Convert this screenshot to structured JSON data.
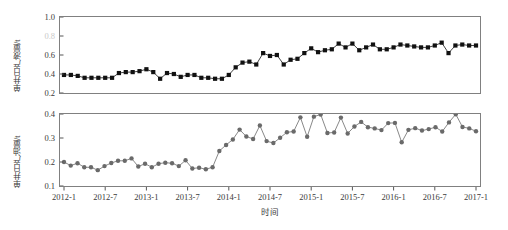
{
  "figure": {
    "background": "#ffffff",
    "xlabel": "时间",
    "xticks": [
      "2012-1",
      "2012-7",
      "2013-1",
      "2013-7",
      "2014-1",
      "2014-7",
      "2015-1",
      "2015-7",
      "2016-1",
      "2016-7",
      "2017-1"
    ]
  },
  "chart_data": [
    {
      "type": "line",
      "panel": "top",
      "title": "",
      "xlabel": "",
      "ylabel": "单井日产液量/t",
      "marker": "square",
      "marker_color": "#111111",
      "line_color": "#111111",
      "grid": false,
      "legend": null,
      "ylim": [
        0.2,
        1.0
      ],
      "yticks": [
        0.2,
        0.4,
        0.6,
        0.8,
        1.0
      ],
      "ytick_labels": [
        "0.2",
        "0.4",
        "0.6",
        "0.8",
        "1.0"
      ],
      "xlim": [
        "2012-1",
        "2017-1"
      ],
      "xticks": [
        "2012-1",
        "2012-7",
        "2013-1",
        "2013-7",
        "2014-1",
        "2014-7",
        "2015-1",
        "2015-7",
        "2016-1",
        "2016-7",
        "2017-1"
      ],
      "x": [
        "2012-1",
        "2012-2",
        "2012-3",
        "2012-4",
        "2012-5",
        "2012-6",
        "2012-7",
        "2012-8",
        "2012-9",
        "2012-10",
        "2012-11",
        "2012-12",
        "2013-1",
        "2013-2",
        "2013-3",
        "2013-4",
        "2013-5",
        "2013-6",
        "2013-7",
        "2013-8",
        "2013-9",
        "2013-10",
        "2013-11",
        "2013-12",
        "2014-1",
        "2014-2",
        "2014-3",
        "2014-4",
        "2014-5",
        "2014-6",
        "2014-7",
        "2014-8",
        "2014-9",
        "2014-10",
        "2014-11",
        "2014-12",
        "2015-1",
        "2015-2",
        "2015-3",
        "2015-4",
        "2015-5",
        "2015-6",
        "2015-7",
        "2015-8",
        "2015-9",
        "2015-10",
        "2015-11",
        "2015-12",
        "2016-1",
        "2016-2",
        "2016-3",
        "2016-4",
        "2016-5",
        "2016-6",
        "2016-7",
        "2016-8",
        "2016-9",
        "2016-10",
        "2016-11",
        "2016-12",
        "2017-1"
      ],
      "values": [
        0.39,
        0.39,
        0.38,
        0.36,
        0.36,
        0.36,
        0.36,
        0.36,
        0.41,
        0.42,
        0.42,
        0.43,
        0.45,
        0.42,
        0.35,
        0.41,
        0.4,
        0.37,
        0.39,
        0.39,
        0.36,
        0.36,
        0.35,
        0.35,
        0.39,
        0.47,
        0.52,
        0.53,
        0.5,
        0.62,
        0.59,
        0.6,
        0.5,
        0.55,
        0.56,
        0.62,
        0.67,
        0.63,
        0.65,
        0.66,
        0.72,
        0.68,
        0.72,
        0.65,
        0.68,
        0.71,
        0.66,
        0.66,
        0.68,
        0.71,
        0.7,
        0.69,
        0.68,
        0.68,
        0.7,
        0.73,
        0.62,
        0.7,
        0.71,
        0.7,
        0.7
      ],
      "ylabel_units": "t"
    },
    {
      "type": "line",
      "panel": "bottom",
      "title": "",
      "xlabel": "时间",
      "ylabel": "单井日产油量/t",
      "marker": "circle",
      "marker_color": "#6a6a6a",
      "line_color": "#6a6a6a",
      "grid": false,
      "legend": null,
      "ylim": [
        0.1,
        0.4
      ],
      "yticks": [
        0.1,
        0.2,
        0.3,
        0.4
      ],
      "ytick_labels": [
        "0.1",
        "0.2",
        "0.3",
        "0.4"
      ],
      "xlim": [
        "2012-1",
        "2017-1"
      ],
      "xticks": [
        "2012-1",
        "2012-7",
        "2013-1",
        "2013-7",
        "2014-1",
        "2014-7",
        "2015-1",
        "2015-7",
        "2016-1",
        "2016-7",
        "2017-1"
      ],
      "x": [
        "2012-1",
        "2012-2",
        "2012-3",
        "2012-4",
        "2012-5",
        "2012-6",
        "2012-7",
        "2012-8",
        "2012-9",
        "2012-10",
        "2012-11",
        "2012-12",
        "2013-1",
        "2013-2",
        "2013-3",
        "2013-4",
        "2013-5",
        "2013-6",
        "2013-7",
        "2013-8",
        "2013-9",
        "2013-10",
        "2013-11",
        "2013-12",
        "2014-1",
        "2014-2",
        "2014-3",
        "2014-4",
        "2014-5",
        "2014-6",
        "2014-7",
        "2014-8",
        "2014-9",
        "2014-10",
        "2014-11",
        "2014-12",
        "2015-1",
        "2015-2",
        "2015-3",
        "2015-4",
        "2015-5",
        "2015-6",
        "2015-7",
        "2015-8",
        "2015-9",
        "2015-10",
        "2015-11",
        "2015-12",
        "2016-1",
        "2016-2",
        "2016-3",
        "2016-4",
        "2016-5",
        "2016-6",
        "2016-7",
        "2016-8",
        "2016-9",
        "2016-10",
        "2016-11",
        "2016-12",
        "2017-1"
      ],
      "values": [
        0.2,
        0.185,
        0.195,
        0.178,
        0.178,
        0.166,
        0.183,
        0.196,
        0.205,
        0.205,
        0.215,
        0.181,
        0.193,
        0.178,
        0.193,
        0.197,
        0.195,
        0.183,
        0.207,
        0.173,
        0.176,
        0.17,
        0.178,
        0.246,
        0.271,
        0.294,
        0.335,
        0.306,
        0.296,
        0.352,
        0.287,
        0.279,
        0.301,
        0.324,
        0.327,
        0.386,
        0.305,
        0.389,
        0.398,
        0.321,
        0.323,
        0.385,
        0.319,
        0.348,
        0.367,
        0.345,
        0.34,
        0.333,
        0.362,
        0.363,
        0.282,
        0.334,
        0.341,
        0.331,
        0.337,
        0.345,
        0.327,
        0.365,
        0.399,
        0.346,
        0.34,
        0.328
      ],
      "ylabel_units": "t"
    }
  ]
}
